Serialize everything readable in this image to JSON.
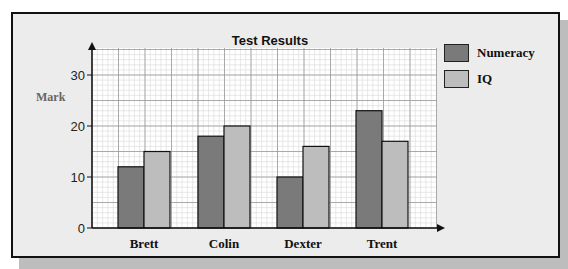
{
  "chart_data": {
    "type": "bar",
    "title": "Test Results",
    "xlabel": "",
    "ylabel": "Mark",
    "categories": [
      "Brett",
      "Colin",
      "Dexter",
      "Trent"
    ],
    "series": [
      {
        "name": "Numeracy",
        "color": "#7a7a7a",
        "values": [
          12,
          18,
          10,
          23
        ]
      },
      {
        "name": "IQ",
        "color": "#bdbdbd",
        "values": [
          15,
          20,
          16,
          17
        ]
      }
    ],
    "yticks": [
      0,
      10,
      20,
      30
    ],
    "ylim": [
      0,
      35
    ],
    "grid": true,
    "legend_position": "right"
  },
  "legend": {
    "items": [
      {
        "label": "Numeracy",
        "color": "#7a7a7a"
      },
      {
        "label": "IQ",
        "color": "#bdbdbd"
      }
    ]
  }
}
